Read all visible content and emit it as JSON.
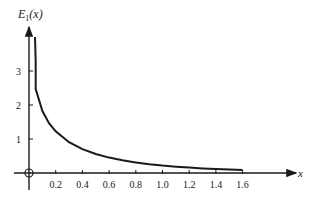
{
  "chart_data": {
    "type": "line",
    "title": "",
    "xlabel": "x",
    "ylabel": "E1(x)",
    "ylabel_display": {
      "base": "E",
      "sub": "1",
      "arg": "(x)"
    },
    "xlim": [
      0,
      1.7
    ],
    "ylim": [
      0,
      4
    ],
    "x_ticks": [
      "0.2",
      "0.4",
      "0.6",
      "0.8",
      "1.0",
      "1.2",
      "1.4",
      "1.6"
    ],
    "y_ticks": [
      "1",
      "2",
      "3"
    ],
    "grid": false,
    "legend": null,
    "series": [
      {
        "name": "E1(x)",
        "x": [
          0.05,
          0.1,
          0.15,
          0.2,
          0.3,
          0.4,
          0.5,
          0.6,
          0.7,
          0.8,
          0.9,
          1.0,
          1.1,
          1.2,
          1.3,
          1.4,
          1.5,
          1.6
        ],
        "y": [
          2.468,
          1.823,
          1.465,
          1.223,
          0.906,
          0.702,
          0.56,
          0.454,
          0.374,
          0.311,
          0.26,
          0.219,
          0.186,
          0.158,
          0.135,
          0.116,
          0.1,
          0.086
        ]
      }
    ],
    "annotations": [
      "origin marked with circled cross"
    ]
  }
}
